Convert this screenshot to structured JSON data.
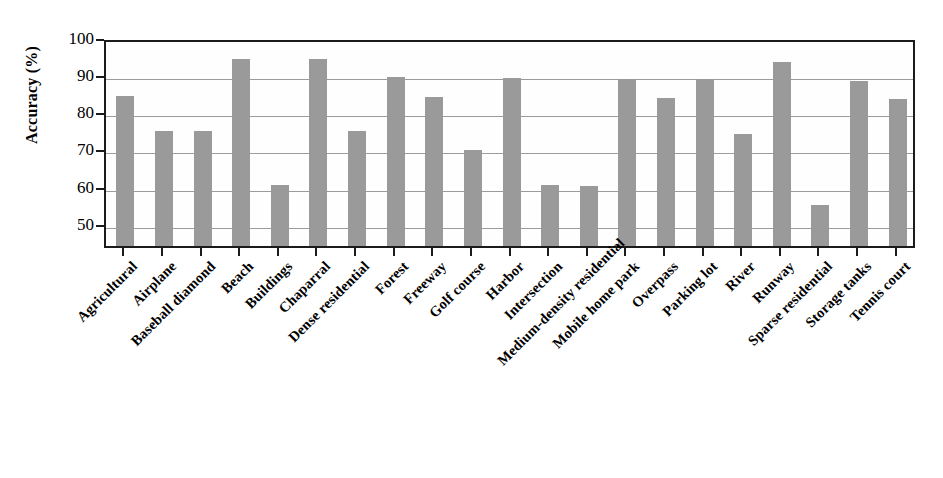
{
  "chart_data": {
    "type": "bar",
    "title": "",
    "xlabel": "",
    "ylabel": "Accuracy (%)",
    "ylim": [
      44,
      100
    ],
    "yticks": [
      50,
      60,
      70,
      80,
      90,
      100
    ],
    "ytick_labels": [
      "50",
      "60",
      "70",
      "80",
      "90",
      "100"
    ],
    "grid": true,
    "legend": "none",
    "bar_color": "#9a9a9a",
    "axis_color": "#1b1b1b",
    "gridline_color": "#9b9b9b",
    "categories": [
      "Agricultural",
      "Airplane",
      "Baseball diamond",
      "Beach",
      "Buildings",
      "Chaparral",
      "Dense residential",
      "Forest",
      "Freeway",
      "Golf course",
      "Harbor",
      "Intersection",
      "Medium-density residential",
      "Mobile home park",
      "Overpass",
      "Parking lot",
      "River",
      "Runway",
      "Sparse residential",
      "Storage tanks",
      "Tennis court"
    ],
    "values": [
      85.5,
      76.0,
      76.0,
      95.5,
      61.5,
      95.5,
      76.0,
      90.5,
      85.2,
      71.0,
      90.2,
      61.5,
      61.3,
      90.0,
      85.0,
      90.0,
      75.2,
      94.7,
      56.2,
      89.5,
      84.7
    ]
  },
  "axes": {
    "y_title": "Accuracy (%)"
  }
}
